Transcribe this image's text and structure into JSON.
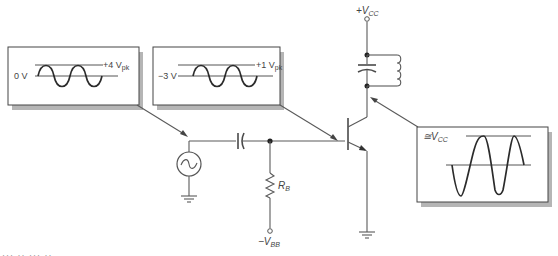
{
  "diagram": {
    "supply": {
      "label_prefix": "+V",
      "label_sub": "CC"
    },
    "bias_supply": {
      "label_prefix": "−V",
      "label_sub": "BB"
    },
    "resistor": {
      "label_prefix": "R",
      "label_sub": "B"
    },
    "inset_source": {
      "baseline_label": "0 V",
      "peak_label": "+4 V",
      "peak_sub": "pk"
    },
    "inset_base": {
      "baseline_label": "−3 V",
      "peak_label": "+1 V",
      "peak_sub": "pk"
    },
    "inset_collector": {
      "level_prefix": "≅V",
      "level_sub": "CC"
    },
    "components": [
      "ac-source",
      "coupling-capacitor",
      "base-resistor",
      "npn-transistor",
      "tank-capacitor",
      "tank-inductor",
      "ground"
    ],
    "caption_fragment": "···  ··  ···  ··"
  }
}
